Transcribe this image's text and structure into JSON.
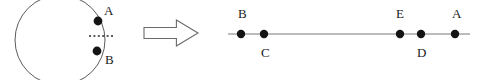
{
  "figure": {
    "background_color": "#ffffff",
    "line_color": "#7a7a7a",
    "dot_color": "#141414",
    "label_color": "#1a1a1a",
    "dotted_color": "#2b2b2b"
  },
  "left_panel": {
    "name": "circle-diagram",
    "circle": {
      "center_x": 60,
      "center_y": 40,
      "radius": 45
    },
    "points": [
      {
        "id": "A",
        "label": "A",
        "x": 98,
        "y": 21,
        "label_x": 104,
        "label_y": 15,
        "label_position": "above-right"
      },
      {
        "id": "B",
        "label": "B",
        "x": 97,
        "y": 51,
        "label_x": 105,
        "label_y": 64,
        "label_position": "below-right"
      }
    ],
    "dotted_segment": {
      "label": "dotted-chord",
      "x1": 89,
      "y1": 36,
      "x2": 113,
      "y2": 36
    }
  },
  "arrow": {
    "name": "transformation-arrow",
    "label": "implies",
    "direction": "right",
    "x": 144,
    "y": 20,
    "width": 54,
    "height": 26
  },
  "right_panel": {
    "name": "number-line-diagram",
    "axis": {
      "x_start": 228,
      "x_end": 470,
      "y": 34
    },
    "points": [
      {
        "id": "B",
        "label": "B",
        "x": 241,
        "label_x": 238,
        "label_y": 18,
        "label_position": "above"
      },
      {
        "id": "C",
        "label": "C",
        "x": 264,
        "label_x": 261,
        "label_y": 57,
        "label_position": "below"
      },
      {
        "id": "E",
        "label": "E",
        "x": 400,
        "label_x": 396,
        "label_y": 18,
        "label_position": "above"
      },
      {
        "id": "D",
        "label": "D",
        "x": 421,
        "label_x": 417,
        "label_y": 57,
        "label_position": "below"
      },
      {
        "id": "A",
        "label": "A",
        "x": 455,
        "label_x": 452,
        "label_y": 18,
        "label_position": "above"
      }
    ],
    "dot_radius": 4.2
  }
}
